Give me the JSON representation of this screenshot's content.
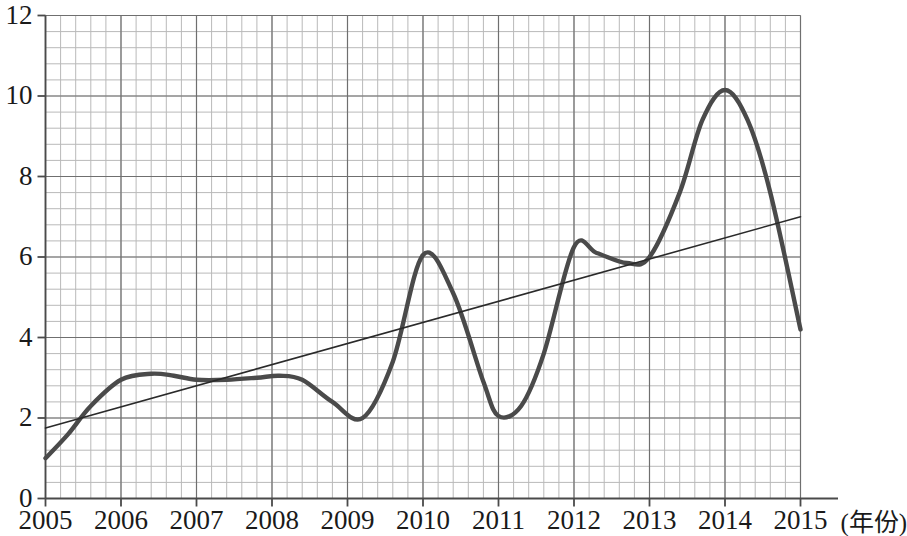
{
  "chart_data": {
    "type": "line",
    "title": "",
    "subtitle": "",
    "xlabel": "(年份)",
    "ylabel": "",
    "xlim": [
      2005,
      2015
    ],
    "ylim": [
      0,
      12
    ],
    "grid": true,
    "grid_minor": true,
    "legend_position": "none",
    "x_tick_labels": [
      "2005",
      "2006",
      "2007",
      "2008",
      "2009",
      "2010",
      "2011",
      "2012",
      "2013",
      "2014",
      "2015"
    ],
    "y_tick_labels": [
      "0",
      "2",
      "4",
      "6",
      "8",
      "10",
      "12"
    ],
    "y_tick_values": [
      0,
      2,
      4,
      6,
      8,
      10,
      12
    ],
    "y_minor_step": 0.4,
    "x_minor_step": 0.2,
    "annotations": [],
    "series": [
      {
        "name": "年度数据曲线",
        "style": "thick-curve",
        "color": "#4a4a4a",
        "width": 4.4,
        "x": [
          2005.0,
          2005.3,
          2005.6,
          2006.0,
          2006.4,
          2006.7,
          2007.0,
          2007.4,
          2007.8,
          2008.1,
          2008.4,
          2008.8,
          2009.2,
          2009.6,
          2010.0,
          2010.4,
          2010.8,
          2011.0,
          2011.3,
          2011.6,
          2012.0,
          2012.3,
          2012.7,
          2013.0,
          2013.4,
          2013.7,
          2014.0,
          2014.3,
          2014.6,
          2015.0
        ],
        "values": [
          1.0,
          1.6,
          2.3,
          2.95,
          3.1,
          3.05,
          2.95,
          2.95,
          3.0,
          3.05,
          2.95,
          2.4,
          2.0,
          3.4,
          6.05,
          5.1,
          2.9,
          2.05,
          2.3,
          3.6,
          6.25,
          6.1,
          5.85,
          6.0,
          7.6,
          9.4,
          10.15,
          9.4,
          7.6,
          4.2
        ]
      },
      {
        "name": "趋势线",
        "style": "thin-trend",
        "color": "#2a2a2a",
        "width": 1.6,
        "x": [
          2005.0,
          2015.0
        ],
        "values": [
          1.75,
          7.0
        ]
      }
    ],
    "key_points": {
      "start_2005": 1.0,
      "plateau_2006_2008": 3.0,
      "trough_2009": 2.0,
      "peak_2010": 6.05,
      "trough_2011": 2.05,
      "peak_2012": 6.25,
      "dip_2013": 5.85,
      "peak_2014": 10.15,
      "end_2015": 4.2,
      "trend_start": 1.75,
      "trend_end": 7.0
    }
  },
  "colors": {
    "curve": "#4a4a4a",
    "trend": "#2a2a2a",
    "grid_minor": "#b9b9b9",
    "grid_major": "#6f6f6f",
    "axis": "#4a4a4a",
    "text": "#1a1a1a",
    "background": "#ffffff"
  }
}
